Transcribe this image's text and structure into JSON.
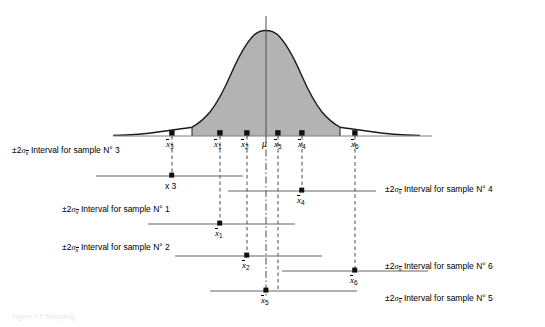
{
  "figure": {
    "type": "sampling-distribution-confidence-interval-diagram",
    "caption": "Figure 7.5 Sampling",
    "axis": {
      "x_left": 113,
      "x_right": 432,
      "baseline_y": 136
    },
    "mu": {
      "label": "μ",
      "x": 266,
      "axis_top_y": 16
    },
    "curve": {
      "shape": "normal",
      "center_x": 266,
      "peak_y": 31,
      "shaded_fill": "#b3b3b3",
      "shade_left_x": 192,
      "shade_right_x": 342,
      "stroke": "#1a1a1a"
    },
    "point_label_text": "x 3"
  },
  "axis_marks": [
    {
      "name": "x3",
      "base": "x",
      "sub": "3",
      "x": 172
    },
    {
      "name": "x1",
      "base": "x",
      "sub": "1",
      "x": 220
    },
    {
      "name": "x2",
      "base": "x",
      "sub": "2",
      "x": 247
    },
    {
      "name": "mu",
      "base": "μ",
      "sub": "",
      "x": 266
    },
    {
      "name": "x5",
      "base": "x",
      "sub": "5",
      "x": 278
    },
    {
      "name": "x4",
      "base": "x",
      "sub": "4",
      "x": 302
    },
    {
      "name": "x6",
      "base": "x",
      "sub": "6",
      "x": 355
    }
  ],
  "intervals": [
    {
      "sample": "3",
      "label_prefix": "±2",
      "label_sigma": "σ",
      "label_sigma_sub": "x",
      "label_text": "Interval for sample N° 3",
      "label_side": "left",
      "label_x": 12,
      "label_y": 146,
      "line_y": 176,
      "x_start": 96,
      "x_end": 243,
      "marker_x": 172,
      "mean_label": "",
      "mean_sub": "",
      "mean_x": 0
    },
    {
      "sample": "1",
      "label_prefix": "±2",
      "label_sigma": "σ",
      "label_sigma_sub": "x",
      "label_text": "Interval for sample N° 1",
      "label_side": "left",
      "label_x": 62,
      "label_y": 205,
      "line_y": 224,
      "x_start": 148,
      "x_end": 295,
      "marker_x": 220,
      "mean_label": "x",
      "mean_sub": "1",
      "mean_x": 220
    },
    {
      "sample": "2",
      "label_prefix": "±2",
      "label_sigma": "σ",
      "label_sigma_sub": "x",
      "label_text": "Interval for sample N° 2",
      "label_side": "left",
      "label_x": 62,
      "label_y": 243,
      "line_y": 256,
      "x_start": 175,
      "x_end": 322,
      "marker_x": 247,
      "mean_label": "x",
      "mean_sub": "2",
      "mean_x": 247
    },
    {
      "sample": "4",
      "label_prefix": "±2",
      "label_sigma": "σ",
      "label_sigma_sub": "x",
      "label_text": "Interval for sample N° 4",
      "label_side": "right",
      "label_x": 385,
      "label_y": 185,
      "line_y": 191,
      "x_start": 228,
      "x_end": 376,
      "marker_x": 302,
      "mean_label": "x",
      "mean_sub": "4",
      "mean_x": 302
    },
    {
      "sample": "6",
      "label_prefix": "±2",
      "label_sigma": "σ",
      "label_sigma_sub": "x",
      "label_text": "Interval for sample N° 6",
      "label_side": "right",
      "label_x": 385,
      "label_y": 262,
      "line_y": 271,
      "x_start": 282,
      "x_end": 428,
      "marker_x": 355,
      "mean_label": "x",
      "mean_sub": "6",
      "mean_x": 355
    },
    {
      "sample": "5",
      "label_prefix": "±2",
      "label_sigma": "σ",
      "label_sigma_sub": "x",
      "label_text": "Interval for sample N° 5",
      "label_side": "right",
      "label_x": 385,
      "label_y": 294,
      "line_y": 291,
      "x_start": 210,
      "x_end": 357,
      "marker_x": 266,
      "mean_label": "x",
      "mean_sub": "5",
      "mean_x": 266
    }
  ],
  "dashed_guides": [
    {
      "x": 172,
      "y_top": 136,
      "y_bottom": 176
    },
    {
      "x": 220,
      "y_top": 136,
      "y_bottom": 224
    },
    {
      "x": 247,
      "y_top": 136,
      "y_bottom": 256
    },
    {
      "x": 278,
      "y_top": 136,
      "y_bottom": 291
    },
    {
      "x": 302,
      "y_top": 136,
      "y_bottom": 191
    },
    {
      "x": 355,
      "y_top": 136,
      "y_bottom": 271
    }
  ],
  "center_guide": {
    "x": 266,
    "y_top": 136,
    "y_bottom": 298,
    "style": "dash-dot"
  }
}
